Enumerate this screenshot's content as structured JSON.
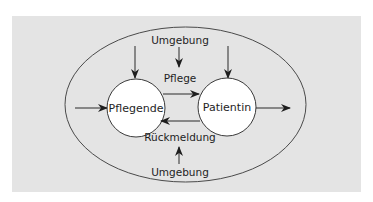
{
  "diagram": {
    "colors": {
      "panel_background": "#e4e4e4",
      "page_background": "#ffffff",
      "stroke": "#3a3a3a",
      "node_fill": "#ffffff",
      "text": "#1e1e1e"
    },
    "boundary": {
      "shape": "ellipse",
      "label_top": "Umgebung",
      "label_bottom": "Umgebung"
    },
    "nodes": [
      {
        "id": "pflegende",
        "label": "Pflegende"
      },
      {
        "id": "patientin",
        "label": "Patientin"
      }
    ],
    "edges": [
      {
        "from": "pflegende",
        "to": "patientin",
        "label": "Pflege"
      },
      {
        "from": "patientin",
        "to": "pflegende",
        "label": "Rückmeldung"
      }
    ],
    "external_arrows": [
      {
        "description": "input from left into Pflegende"
      },
      {
        "description": "output from Patientin to right"
      },
      {
        "description": "down arrow into Pflegende from top"
      },
      {
        "description": "down arrow into Patientin from top"
      },
      {
        "description": "down arrow from top Umgebung toward Pflege"
      },
      {
        "description": "up arrow from bottom Umgebung toward Rückmeldung"
      }
    ]
  }
}
